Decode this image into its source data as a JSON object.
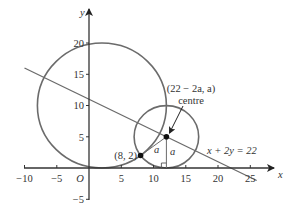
{
  "figure": {
    "type": "coordinate-geometry",
    "colors": {
      "axis": "#333333",
      "curve": "#6b6b6b",
      "point": "#111111",
      "text": "#333333",
      "background": "#ffffff"
    }
  },
  "axes": {
    "x_label": "x",
    "y_label": "y",
    "origin_label": "O",
    "x_range": [
      -10,
      27
    ],
    "y_range": [
      -5,
      23
    ],
    "x_ticks": [
      {
        "value": -10,
        "label": "−10"
      },
      {
        "value": -5,
        "label": "−5"
      },
      {
        "value": 5,
        "label": "5"
      },
      {
        "value": 10,
        "label": "10"
      },
      {
        "value": 15,
        "label": "15"
      },
      {
        "value": 20,
        "label": "20"
      },
      {
        "value": 25,
        "label": "25"
      }
    ],
    "y_ticks": [
      {
        "value": -5,
        "label": "−5"
      },
      {
        "value": 5,
        "label": "5"
      },
      {
        "value": 10,
        "label": "10"
      },
      {
        "value": 15,
        "label": "15"
      },
      {
        "value": 20,
        "label": "20"
      }
    ]
  },
  "circles": [
    {
      "name": "large-circle",
      "centre": [
        2,
        10
      ],
      "radius": 10
    },
    {
      "name": "small-circle",
      "centre": [
        12,
        5
      ],
      "radius": 5
    }
  ],
  "line": {
    "equation": "x + 2y = 22",
    "label": "x + 2y = 22",
    "from": [
      -10,
      16
    ],
    "to": [
      26,
      -2
    ]
  },
  "points": [
    {
      "name": "point-8-2",
      "coords": [
        8,
        2
      ],
      "label": "(8, 2)"
    },
    {
      "name": "centre-point",
      "coords": [
        12,
        5
      ],
      "label": "(22 − 2a, a)",
      "sublabel": "centre"
    }
  ],
  "annotations": {
    "radius_label_1": "a",
    "radius_label_2": "a",
    "centre_coord_label": "(22 − 2a, a)",
    "centre_word": "centre",
    "right_angle_marker": true
  }
}
